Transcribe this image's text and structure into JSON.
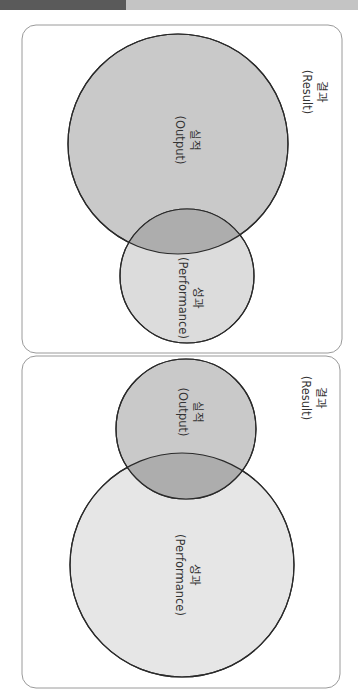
{
  "panels": [
    {
      "id": "top",
      "labels": {
        "output": {
          "ko": "실적",
          "en": "(Output)"
        },
        "performance": {
          "ko": "성과",
          "en": "(Performance)"
        },
        "result": {
          "ko": "결과",
          "en": "(Result)"
        }
      },
      "colors": {
        "output_fill": "#c9c9c9",
        "performance_fill": "#dcdcdc",
        "overlap_fill": "#adadad"
      }
    },
    {
      "id": "bottom",
      "labels": {
        "output": {
          "ko": "실적",
          "en": "(Output)"
        },
        "performance": {
          "ko": "성과",
          "en": "(Performance)"
        },
        "result": {
          "ko": "결과",
          "en": "(Result)"
        }
      },
      "colors": {
        "output_fill": "#c9c9c9",
        "performance_fill": "#e6e6e6",
        "overlap_fill": "#adadad"
      }
    }
  ]
}
